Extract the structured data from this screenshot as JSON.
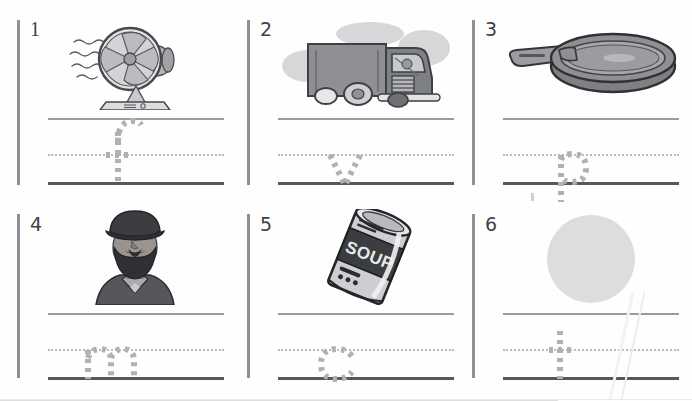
{
  "worksheet": {
    "title": "Beginning sound letter tracing worksheet",
    "background_color": "#fefefe",
    "rule_colors": {
      "top_line": "#9a9b9f",
      "mid_dotted_line": "#b9babe",
      "baseline": "#56585d",
      "divider": "#8f9094",
      "trace_letter": "#b0b1b5"
    },
    "items": [
      {
        "number": "1",
        "picture_name": "electric-desk-fan",
        "picture_label": "fan",
        "trace_letter": "f",
        "letter_zone": "ascender-to-baseline"
      },
      {
        "number": "2",
        "picture_name": "delivery-van-truck",
        "picture_label": "van",
        "trace_letter": "v",
        "letter_zone": "midline-to-baseline"
      },
      {
        "number": "3",
        "picture_name": "frying-pan",
        "picture_label": "pan",
        "trace_letter": "p",
        "letter_zone": "midline-to-descender"
      },
      {
        "number": "4",
        "picture_name": "bearded-man-with-hat",
        "picture_label": "man",
        "trace_letter": "m",
        "letter_zone": "midline-to-baseline"
      },
      {
        "number": "5",
        "picture_name": "soup-can",
        "picture_label": "can",
        "trace_letter": "c",
        "letter_zone": "midline-to-baseline",
        "picture_text": "SOUP"
      },
      {
        "number": "6",
        "picture_name": "plain-circle-ball",
        "picture_label": "ball",
        "trace_letter": "t",
        "letter_zone": "ascender-to-baseline"
      }
    ]
  }
}
